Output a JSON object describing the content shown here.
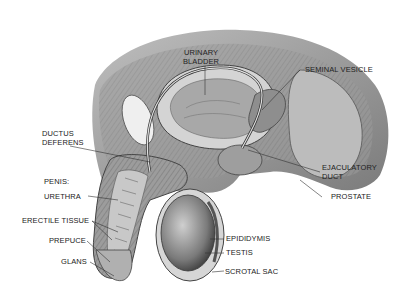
{
  "diagram": {
    "type": "anatomical illustration",
    "labels": {
      "urinary_bladder_1": "URINARY",
      "urinary_bladder_2": "BLADDER",
      "seminal_vesicle": "SEMINAL VESICLE",
      "ductus_deferens_1": "DUCTUS",
      "ductus_deferens_2": "DEFERENS",
      "ejaculatory_duct_1": "EJACULATORY",
      "ejaculatory_duct_2": "DUCT",
      "prostate": "PROSTATE",
      "penis_header": "PENIS:",
      "urethra": "URETHRA",
      "erectile_tissue": "ERECTILE TISSUE",
      "prepuce": "PREPUCE",
      "glans": "GLANS",
      "epididymis": "EPIDIDYMIS",
      "testis": "TESTIS",
      "scrotal_sac": "SCROTAL SAC"
    },
    "colors": {
      "background": "#ffffff",
      "label_text": "#222222",
      "leader_line": "#333333"
    }
  }
}
